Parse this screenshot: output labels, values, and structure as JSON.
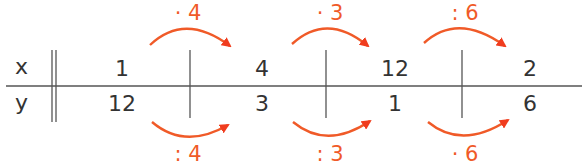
{
  "table": {
    "row_labels": {
      "x": "x",
      "y": "y"
    },
    "columns": [
      {
        "x": "1",
        "y": "12"
      },
      {
        "x": "4",
        "y": "3"
      },
      {
        "x": "12",
        "y": "1"
      },
      {
        "x": "2",
        "y": "6"
      }
    ]
  },
  "arrows": {
    "top": [
      {
        "label": "· 4"
      },
      {
        "label": "· 3"
      },
      {
        "label": ": 6"
      }
    ],
    "bottom": [
      {
        "label": ": 4"
      },
      {
        "label": ": 3"
      },
      {
        "label": "· 6"
      }
    ]
  },
  "colors": {
    "text": "#333333",
    "lines": "#555555",
    "arrow": "#f05a28"
  }
}
